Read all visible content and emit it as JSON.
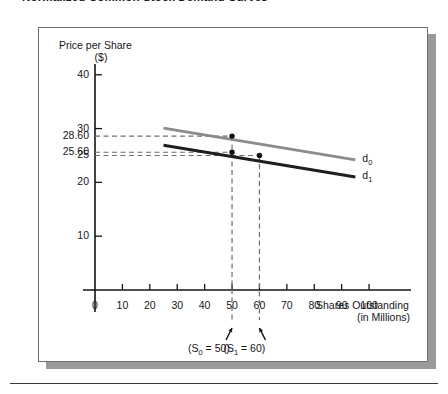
{
  "figure": {
    "title": "Normalized Common Stock Demand Curves"
  },
  "chart_data": {
    "type": "line",
    "title": "Normalized Common Stock Demand Curves",
    "xlabel": "Shares Outstanding",
    "xlabel_sub": "(in Millions)",
    "ylabel": "Price per Share",
    "ylabel_sub": "($)",
    "xlim": [
      0,
      108
    ],
    "ylim": [
      0,
      42
    ],
    "grid": false,
    "legend_position": "right-inline",
    "xticks": [
      0,
      10,
      20,
      30,
      40,
      50,
      60,
      70,
      80,
      90,
      100
    ],
    "xtick_labels": [
      "0",
      "10",
      "20",
      "30",
      "40",
      "50",
      "60",
      "70",
      "80",
      "90",
      "100"
    ],
    "yticks": [
      10,
      20,
      30,
      40
    ],
    "ytick_labels": [
      "10",
      "20",
      "30",
      "40"
    ],
    "y_value_labels": [
      "28.60",
      "25.60",
      "25"
    ],
    "y_values_annotated": [
      28.6,
      25.6,
      25.0
    ],
    "series": [
      {
        "name": "d0",
        "label": "d",
        "label_sub": "0",
        "color": "#8c8c8c",
        "x": [
          25,
          95
        ],
        "y": [
          30.1,
          24.2
        ]
      },
      {
        "name": "d1",
        "label": "d",
        "label_sub": "1",
        "color": "#1f1f1f",
        "x": [
          25,
          95
        ],
        "y": [
          26.9,
          21.0
        ]
      }
    ],
    "points": [
      {
        "series": "d0",
        "x": 50,
        "y": 28.6,
        "label": "28.60"
      },
      {
        "series": "d1",
        "x": 50,
        "y": 25.6,
        "label": "25.60"
      },
      {
        "series": "d1",
        "x": 60,
        "y": 25.0,
        "label": "25"
      }
    ],
    "dashed_guides": {
      "horizontal": [
        28.6,
        25.6,
        25.0
      ],
      "vertical": [
        50,
        60
      ],
      "color": "#6e6e6e"
    },
    "annotations": [
      {
        "name": "s0-annotation",
        "text_prefix": "(S",
        "text_sub": "0",
        "text_suffix": " = 50)",
        "x": 50
      },
      {
        "name": "s1-annotation",
        "text_prefix": "(S",
        "text_sub": "1",
        "text_suffix": " = 60)",
        "x": 60
      }
    ]
  }
}
